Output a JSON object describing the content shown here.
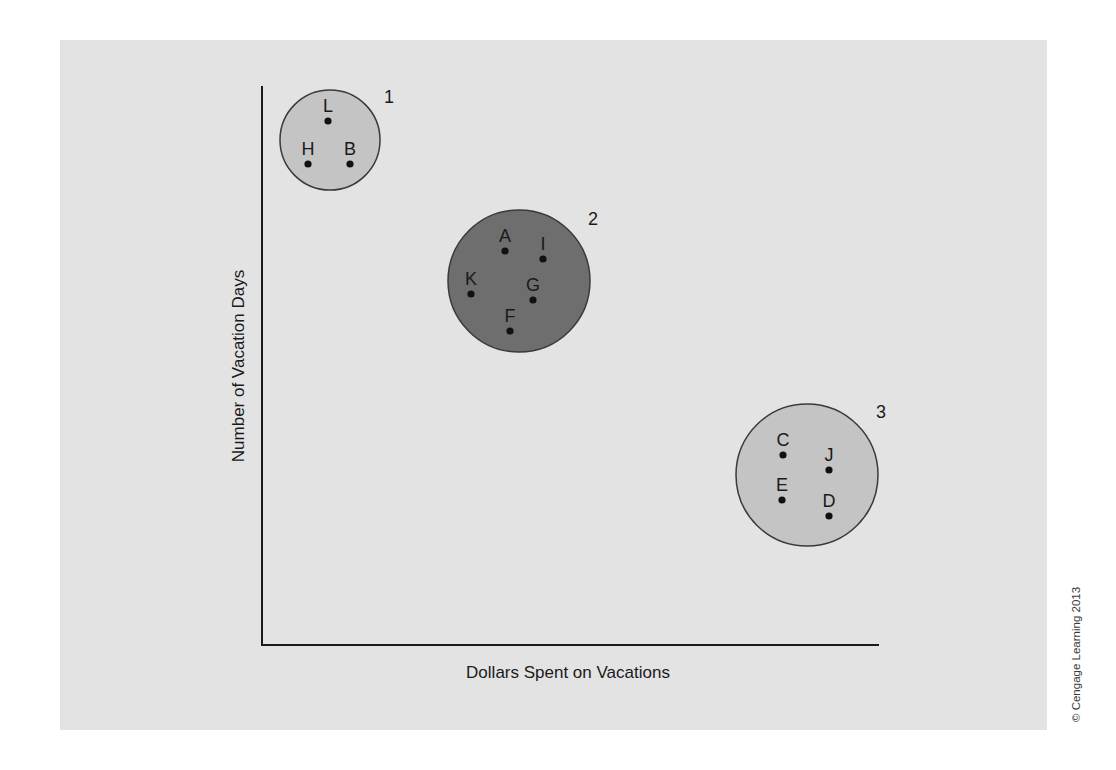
{
  "chart_data": {
    "type": "scatter",
    "title": "",
    "xlabel": "Dollars Spent on Vacations",
    "ylabel": "Number of Vacation Days",
    "grid": false,
    "clusters": [
      {
        "id": "1",
        "label": "1",
        "fill": "#c4c4c4",
        "center": [
          330,
          140
        ],
        "r": 50,
        "label_pos": [
          384,
          103
        ],
        "points": [
          {
            "name": "L",
            "x": 328,
            "y": 121
          },
          {
            "name": "H",
            "x": 308,
            "y": 164
          },
          {
            "name": "B",
            "x": 350,
            "y": 164
          }
        ]
      },
      {
        "id": "2",
        "label": "2",
        "fill": "#6e6e6e",
        "center": [
          519,
          281
        ],
        "r": 71,
        "label_pos": [
          588,
          225
        ],
        "points": [
          {
            "name": "A",
            "x": 505,
            "y": 251
          },
          {
            "name": "I",
            "x": 543,
            "y": 259
          },
          {
            "name": "K",
            "x": 471,
            "y": 294
          },
          {
            "name": "G",
            "x": 533,
            "y": 300
          },
          {
            "name": "F",
            "x": 510,
            "y": 331
          }
        ]
      },
      {
        "id": "3",
        "label": "3",
        "fill": "#c4c4c4",
        "center": [
          807,
          475
        ],
        "r": 71,
        "label_pos": [
          876,
          418
        ],
        "points": [
          {
            "name": "C",
            "x": 783,
            "y": 455
          },
          {
            "name": "J",
            "x": 829,
            "y": 470
          },
          {
            "name": "E",
            "x": 782,
            "y": 500
          },
          {
            "name": "D",
            "x": 829,
            "y": 516
          }
        ]
      }
    ]
  },
  "axes": {
    "x_title": "Dollars Spent on Vacations",
    "y_title": "Number of Vacation Days"
  },
  "credit": "© Cengage Learning 2013",
  "colors": {
    "panel": "#e3e3e3",
    "axis": "#1a1a1a",
    "light_cluster": "#c4c4c4",
    "dark_cluster": "#6e6e6e",
    "outline": "#3a3a3a"
  }
}
